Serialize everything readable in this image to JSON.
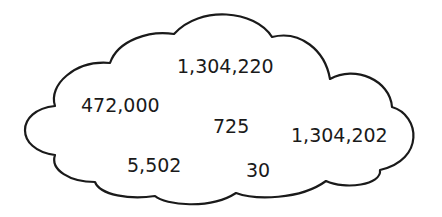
{
  "diagram": {
    "shape": "cloud",
    "outline_color": "#1a1a1a",
    "fill_color": "#ffffff",
    "numbers": [
      {
        "label": "1,304,220",
        "x": 177,
        "y": 58
      },
      {
        "label": "472,000",
        "x": 81,
        "y": 97
      },
      {
        "label": "725",
        "x": 213,
        "y": 118
      },
      {
        "label": "1,304,202",
        "x": 291,
        "y": 127
      },
      {
        "label": "5,502",
        "x": 127,
        "y": 157
      },
      {
        "label": "30",
        "x": 246,
        "y": 162
      }
    ]
  }
}
